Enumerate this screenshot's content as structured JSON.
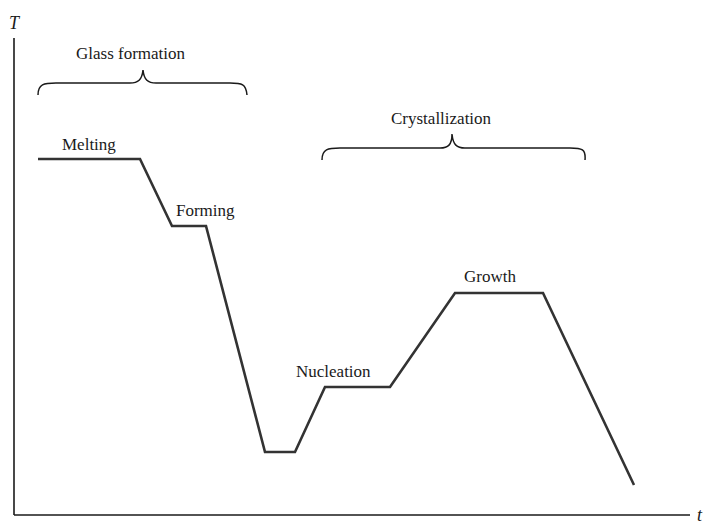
{
  "axes": {
    "y_label": "T",
    "x_label": "t"
  },
  "brackets": {
    "glass": {
      "label": "Glass formation"
    },
    "crystal": {
      "label": "Crystallization"
    }
  },
  "stages": {
    "melting": "Melting",
    "forming": "Forming",
    "nucleation": "Nucleation",
    "growth": "Growth"
  },
  "colors": {
    "line": "#333333",
    "axis": "#1a1a1a"
  },
  "profile_points": [
    [
      38,
      159
    ],
    [
      140,
      159
    ],
    [
      172,
      226
    ],
    [
      206,
      226
    ],
    [
      265,
      452
    ],
    [
      295,
      452
    ],
    [
      325,
      387
    ],
    [
      390,
      387
    ],
    [
      455,
      293
    ],
    [
      543,
      293
    ],
    [
      634,
      485
    ]
  ]
}
